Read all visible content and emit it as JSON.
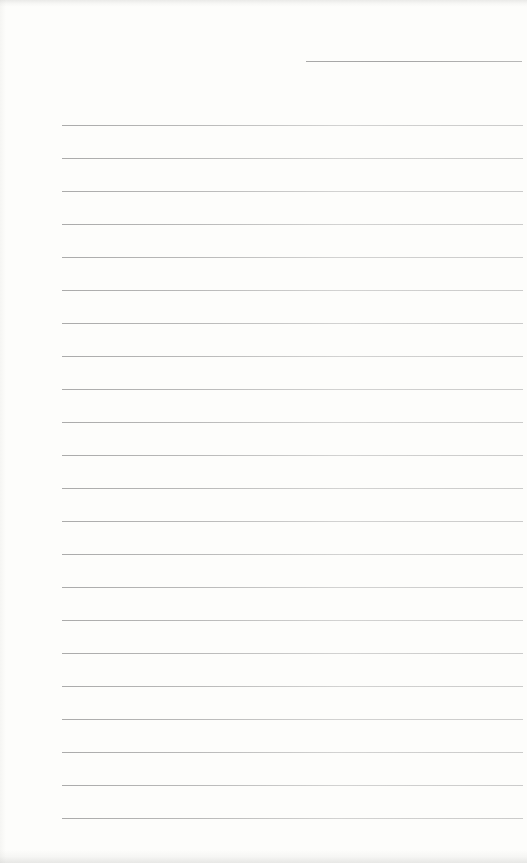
{
  "page": {
    "kind": "blank-ruled-notebook-page",
    "background_color": "#fdfdfb",
    "rule_color": "#9a9a9a",
    "header_rule": {
      "top": 61,
      "left": 306,
      "width": 216
    },
    "ruled_lines": {
      "count": 22,
      "start_y": 125,
      "spacing": 33,
      "left": 62,
      "width": 461
    }
  }
}
